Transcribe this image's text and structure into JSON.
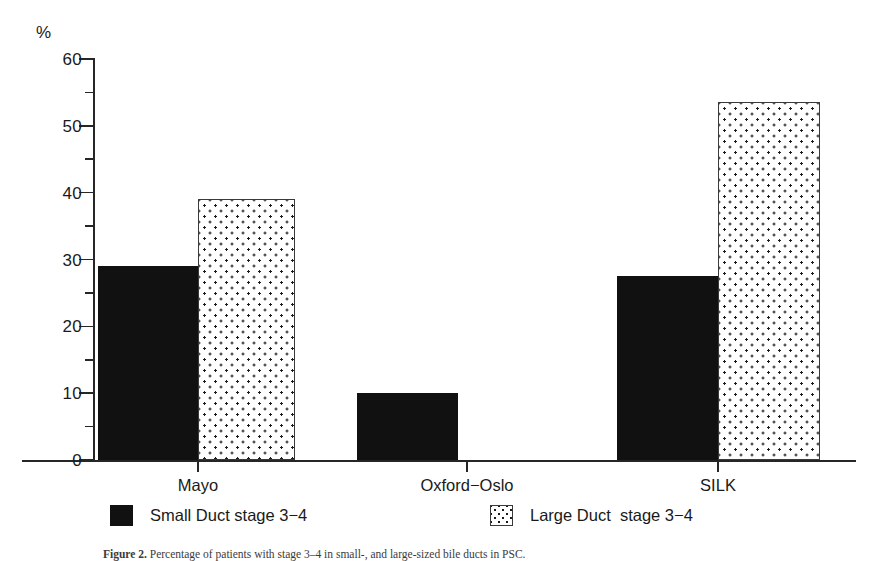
{
  "figure": {
    "axis_unit": "%",
    "caption_label": "Figure 2.",
    "caption_text": "  Percentage of patients with stage 3–4 in small-, and large-sized bile ducts in PSC."
  },
  "chart_data": {
    "type": "bar",
    "title": "",
    "xlabel": "",
    "ylabel": "%",
    "ylim": [
      0,
      60
    ],
    "ytick_major_step": 10,
    "ytick_minor_step": 5,
    "ytick_labels": [
      "0",
      "10",
      "20",
      "30",
      "40",
      "50",
      "60"
    ],
    "grid": false,
    "legend_position": "bottom",
    "categories": [
      "Mayo",
      "Oxford−Oslo",
      "SILK"
    ],
    "series": [
      {
        "name": "Small Duct stage 3−4",
        "fill": "solid-black",
        "color": "#111111",
        "values": [
          29,
          10,
          27.5
        ]
      },
      {
        "name": "Large Duct  stage 3−4",
        "fill": "dotted",
        "color": "#ffffff",
        "values": [
          39,
          0,
          53.5
        ]
      }
    ]
  },
  "y_ticks": [
    {
      "value": 60,
      "label": "60",
      "type": "major"
    },
    {
      "value": 55,
      "label": "",
      "type": "minor"
    },
    {
      "value": 50,
      "label": "50",
      "type": "major"
    },
    {
      "value": 45,
      "label": "",
      "type": "minor"
    },
    {
      "value": 40,
      "label": "40",
      "type": "major"
    },
    {
      "value": 35,
      "label": "",
      "type": "minor"
    },
    {
      "value": 30,
      "label": "30",
      "type": "major"
    },
    {
      "value": 25,
      "label": "",
      "type": "minor"
    },
    {
      "value": 20,
      "label": "20",
      "type": "major"
    },
    {
      "value": 15,
      "label": "",
      "type": "minor"
    },
    {
      "value": 10,
      "label": "10",
      "type": "major"
    },
    {
      "value": 5,
      "label": "",
      "type": "minor"
    },
    {
      "value": 0,
      "label": "0",
      "type": "major"
    }
  ],
  "bars": [
    {
      "name": "bar-mayo-small-duct",
      "category": "Mayo",
      "series": "Small Duct stage 3−4",
      "value": 29,
      "fill": "solid",
      "left": 98,
      "width": 100
    },
    {
      "name": "bar-mayo-large-duct",
      "category": "Mayo",
      "series": "Large Duct  stage 3−4",
      "value": 39,
      "fill": "dotted",
      "left": 198,
      "width": 97
    },
    {
      "name": "bar-oxford-oslo-small-duct",
      "category": "Oxford−Oslo",
      "series": "Small Duct stage 3−4",
      "value": 10,
      "fill": "solid",
      "left": 357,
      "width": 101
    },
    {
      "name": "bar-silk-small-duct",
      "category": "SILK",
      "series": "Small Duct stage 3−4",
      "value": 27.5,
      "fill": "solid",
      "left": 617,
      "width": 101
    },
    {
      "name": "bar-silk-large-duct",
      "category": "SILK",
      "series": "Large Duct  stage 3−4",
      "value": 53.5,
      "fill": "dotted",
      "left": 718,
      "width": 102
    }
  ],
  "x_axis": {
    "ticks": [
      {
        "label": "Mayo",
        "x": 198
      },
      {
        "label": "Oxford−Oslo",
        "x": 467
      },
      {
        "label": "SILK",
        "x": 718
      }
    ]
  },
  "legend": {
    "items": [
      {
        "label": "Small Duct stage 3−4",
        "fill": "solid"
      },
      {
        "label": "Large Duct  stage 3−4",
        "fill": "dotted"
      }
    ]
  }
}
